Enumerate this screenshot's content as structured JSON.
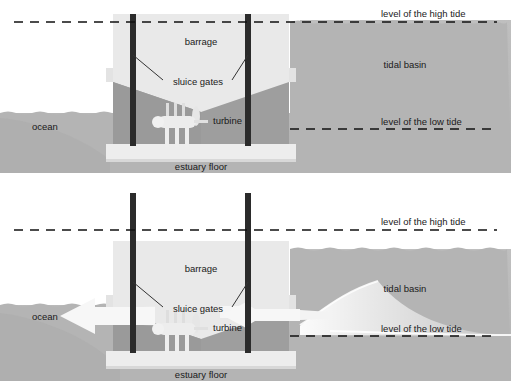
{
  "diagram": {
    "panels": [
      {
        "id": "panel-high-tide",
        "state": "sluice gates closed, basin full at high tide",
        "labels": {
          "barrage": "barrage",
          "sluice_gates": "sluice gates",
          "turbine": "turbine",
          "estuary_floor": "estuary floor",
          "ocean": "ocean",
          "tidal_basin": "tidal basin",
          "high_tide": "level of the high tide",
          "low_tide": "level of the low tide"
        }
      },
      {
        "id": "panel-low-tide",
        "state": "sluice gates open, water flowing from basin through turbine to ocean",
        "labels": {
          "barrage": "barrage",
          "sluice_gates": "sluice gates",
          "turbine": "turbine",
          "estuary_floor": "estuary floor",
          "ocean": "ocean",
          "tidal_basin": "tidal basin",
          "high_tide": "level of the high tide",
          "low_tide": "level of the low tide"
        }
      }
    ],
    "colors": {
      "background": "#ffffff",
      "water": "#b4b4b4",
      "water_deep": "#9a9a9a",
      "seabed": "#b9b9b9",
      "barrage_body": "#dcdcdc",
      "barrage_light": "#e8e8e8",
      "barrage_base": "#ededed",
      "sluice_gate": "#2b2b2b",
      "arrow": "#f2f2f2",
      "turbine": "#e4e4e4",
      "tide_line": "#111111",
      "text": "#1a1a1a"
    }
  }
}
